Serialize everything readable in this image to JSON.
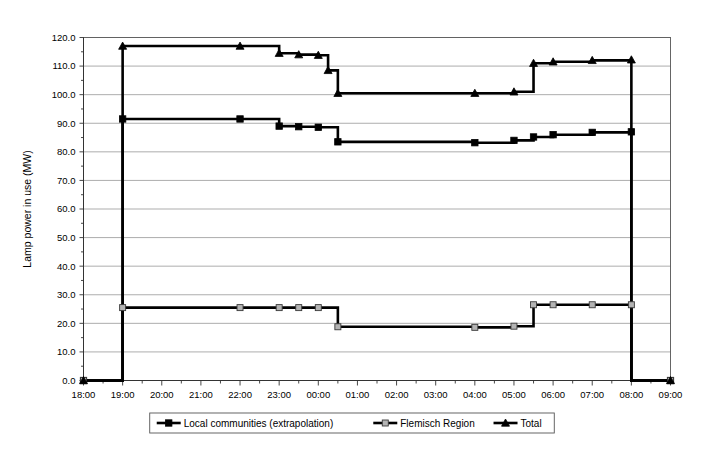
{
  "chart_data": {
    "type": "line",
    "title": "",
    "xlabel": "",
    "ylabel": "Lamp power in use (MW)",
    "ylim": [
      0,
      120
    ],
    "ytick_step": 10,
    "yticks": [
      "0.0",
      "10.0",
      "20.0",
      "30.0",
      "40.0",
      "50.0",
      "60.0",
      "70.0",
      "80.0",
      "90.0",
      "100.0",
      "110.0",
      "120.0"
    ],
    "x": [
      "18:00",
      "19:00",
      "20:00",
      "21:00",
      "22:00",
      "23:00",
      "00:00",
      "01:00",
      "02:00",
      "03:00",
      "04:00",
      "05:00",
      "06:00",
      "07:00",
      "08:00",
      "09:00"
    ],
    "xticks": [
      "18:00",
      "19:00",
      "20:00",
      "21:00",
      "22:00",
      "23:00",
      "00:00",
      "01:00",
      "02:00",
      "03:00",
      "04:00",
      "05:00",
      "06:00",
      "07:00",
      "08:00",
      "09:00"
    ],
    "xlim": [
      "18:00",
      "09:00"
    ],
    "grid": true,
    "legend_position": "bottom",
    "step_type": "post",
    "series": [
      {
        "name": "Local communities (extrapolation)",
        "marker": "filled-square",
        "points": [
          {
            "t": "18:00",
            "v": 0.0
          },
          {
            "t": "19:00",
            "v": 0.0
          },
          {
            "t": "19:00",
            "v": 91.5
          },
          {
            "t": "22:00",
            "v": 91.5
          },
          {
            "t": "23:00",
            "v": 89.0
          },
          {
            "t": "23:30",
            "v": 88.8
          },
          {
            "t": "00:00",
            "v": 88.6
          },
          {
            "t": "00:30",
            "v": 83.5
          },
          {
            "t": "04:00",
            "v": 83.2
          },
          {
            "t": "05:00",
            "v": 84.0
          },
          {
            "t": "05:30",
            "v": 85.2
          },
          {
            "t": "06:00",
            "v": 86.0
          },
          {
            "t": "07:00",
            "v": 86.8
          },
          {
            "t": "08:00",
            "v": 87.0
          },
          {
            "t": "08:00",
            "v": 0.0
          },
          {
            "t": "09:00",
            "v": 0.0
          }
        ]
      },
      {
        "name": "Flemisch Region",
        "marker": "open-square",
        "points": [
          {
            "t": "18:00",
            "v": 0.0
          },
          {
            "t": "19:00",
            "v": 0.0
          },
          {
            "t": "19:00",
            "v": 25.5
          },
          {
            "t": "22:00",
            "v": 25.5
          },
          {
            "t": "23:00",
            "v": 25.5
          },
          {
            "t": "23:30",
            "v": 25.5
          },
          {
            "t": "00:00",
            "v": 25.5
          },
          {
            "t": "00:30",
            "v": 18.8
          },
          {
            "t": "04:00",
            "v": 18.6
          },
          {
            "t": "05:00",
            "v": 19.0
          },
          {
            "t": "05:30",
            "v": 26.5
          },
          {
            "t": "06:00",
            "v": 26.5
          },
          {
            "t": "07:00",
            "v": 26.5
          },
          {
            "t": "08:00",
            "v": 26.5
          },
          {
            "t": "08:00",
            "v": 0.0
          },
          {
            "t": "09:00",
            "v": 0.0
          }
        ]
      },
      {
        "name": "Total",
        "marker": "filled-triangle",
        "points": [
          {
            "t": "18:00",
            "v": 0.0
          },
          {
            "t": "19:00",
            "v": 0.0
          },
          {
            "t": "19:00",
            "v": 117.0
          },
          {
            "t": "22:00",
            "v": 117.0
          },
          {
            "t": "23:00",
            "v": 114.5
          },
          {
            "t": "23:30",
            "v": 114.0
          },
          {
            "t": "00:00",
            "v": 113.8
          },
          {
            "t": "00:15",
            "v": 108.5
          },
          {
            "t": "00:30",
            "v": 100.5
          },
          {
            "t": "04:00",
            "v": 100.5
          },
          {
            "t": "05:00",
            "v": 101.0
          },
          {
            "t": "05:30",
            "v": 111.0
          },
          {
            "t": "06:00",
            "v": 111.5
          },
          {
            "t": "07:00",
            "v": 112.0
          },
          {
            "t": "08:00",
            "v": 112.2
          },
          {
            "t": "08:00",
            "v": 0.0
          },
          {
            "t": "09:00",
            "v": 0.0
          }
        ]
      }
    ],
    "legend": [
      {
        "label": "Local communities (extrapolation)",
        "marker": "filled-square"
      },
      {
        "label": "Flemisch Region",
        "marker": "open-square"
      },
      {
        "label": "Total",
        "marker": "filled-triangle"
      }
    ],
    "colors": {
      "line": "#000000",
      "grid": "#8a8a8a",
      "frame": "#555555",
      "background": "#ffffff",
      "open_marker_fill": "#b4b4b4"
    }
  }
}
